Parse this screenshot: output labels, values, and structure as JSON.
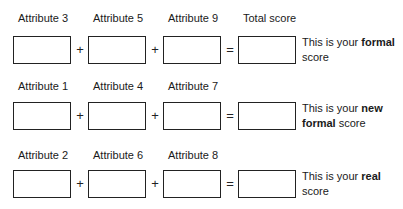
{
  "rows": [
    {
      "labels": [
        "Attribute 3",
        "Attribute 5",
        "Attribute 9",
        "Total score"
      ],
      "operators": [
        "+",
        "+",
        "="
      ],
      "description": {
        "prefix": "This is your ",
        "bold": "formal",
        "suffix": " score"
      }
    },
    {
      "labels": [
        "Attribute 1",
        "Attribute 4",
        "Attribute 7",
        ""
      ],
      "operators": [
        "+",
        "+",
        "="
      ],
      "description": {
        "prefix": "This is your ",
        "bold": "new formal",
        "suffix": " score"
      }
    },
    {
      "labels": [
        "Attribute 2",
        "Attribute 6",
        "Attribute 8",
        ""
      ],
      "operators": [
        "+",
        "+",
        "="
      ],
      "description": {
        "prefix": "This is your ",
        "bold": "real",
        "suffix": " score"
      }
    }
  ]
}
